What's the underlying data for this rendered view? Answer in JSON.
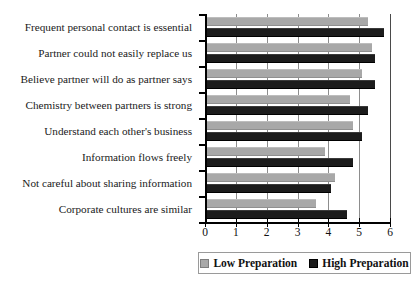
{
  "chart_data": {
    "type": "bar",
    "orientation": "horizontal",
    "title": "",
    "xlabel": "",
    "ylabel": "",
    "xlim": [
      0,
      6
    ],
    "xticks": [
      0,
      1,
      2,
      3,
      4,
      5,
      6
    ],
    "xtick_labels": [
      "0",
      "1",
      "2",
      "3",
      "4",
      "5",
      "6"
    ],
    "grid": true,
    "grid_axis": "x",
    "legend_position": "bottom",
    "categories": [
      "Frequent personal contact is essential",
      "Partner could not easily replace us",
      "Believe partner will do as partner says",
      "Chemistry between partners is strong",
      "Understand each other's business",
      "Information flows freely",
      "Not careful about sharing information",
      "Corporate cultures are similar"
    ],
    "series": [
      {
        "name": "Low Preparation",
        "color": "#a8a8a8",
        "values": [
          5.3,
          5.4,
          5.1,
          4.7,
          4.8,
          3.9,
          4.2,
          3.6
        ]
      },
      {
        "name": "High Preparation",
        "color": "#1c1c1c",
        "values": [
          5.8,
          5.5,
          5.5,
          5.3,
          5.1,
          4.8,
          4.1,
          4.6
        ]
      }
    ]
  },
  "legend": {
    "items": [
      {
        "label": "Low Preparation",
        "swatch": "low"
      },
      {
        "label": "High Preparation",
        "swatch": "high"
      }
    ]
  }
}
